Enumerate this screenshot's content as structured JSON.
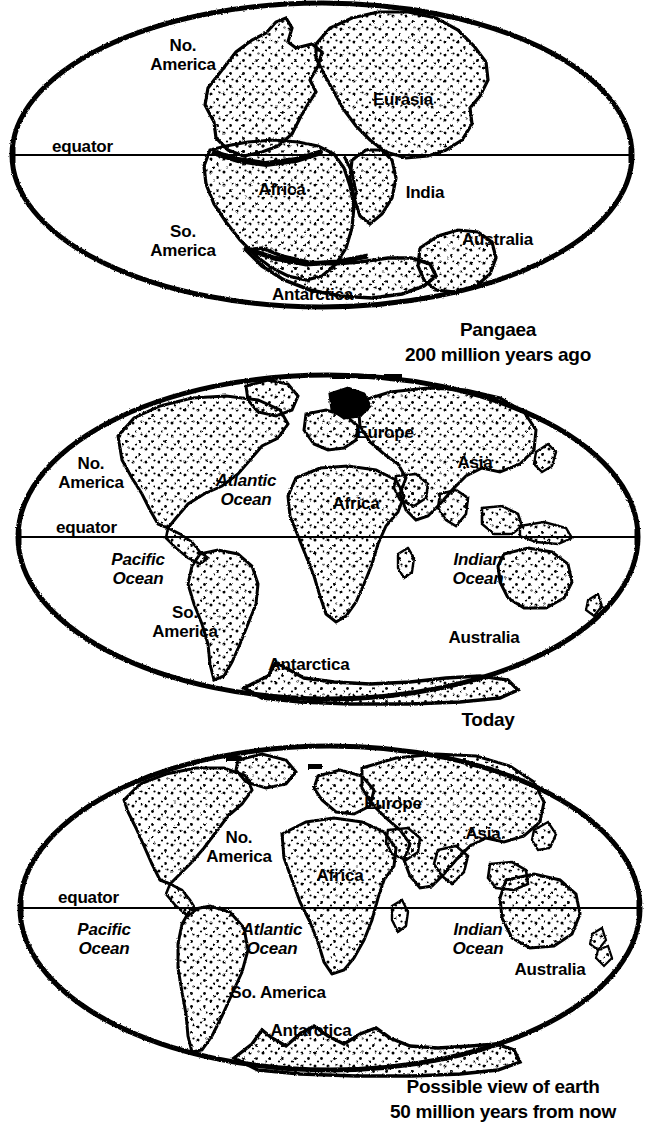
{
  "document": {
    "title": "Continental Drift — Pangaea, Today, and the Future",
    "background_color": "#ffffff",
    "ink_color": "#000000"
  },
  "panels": [
    {
      "id": "pangaea",
      "caption_line1": "Pangaea",
      "caption_line2": "200 million years ago",
      "equator_label": "equator",
      "labels": [
        {
          "name": "no-america",
          "text": "No.\nAmerica",
          "style": "land"
        },
        {
          "name": "eurasia",
          "text": "Eurasia",
          "style": "land"
        },
        {
          "name": "africa",
          "text": "Africa",
          "style": "land"
        },
        {
          "name": "india",
          "text": "India",
          "style": "land"
        },
        {
          "name": "so-america",
          "text": "So.\nAmerica",
          "style": "land"
        },
        {
          "name": "australia",
          "text": "Australia",
          "style": "land"
        },
        {
          "name": "antarctica",
          "text": "Antarctica",
          "style": "land"
        }
      ]
    },
    {
      "id": "today",
      "caption_line1": "Today",
      "caption_line2": "",
      "equator_label": "equator",
      "labels": [
        {
          "name": "no-america",
          "text": "No.\nAmerica",
          "style": "land"
        },
        {
          "name": "europe",
          "text": "Europe",
          "style": "land"
        },
        {
          "name": "asia",
          "text": "Asia",
          "style": "land"
        },
        {
          "name": "africa",
          "text": "Africa",
          "style": "land"
        },
        {
          "name": "atlantic-ocean",
          "text": "Atlantic\nOcean",
          "style": "ocean"
        },
        {
          "name": "pacific-ocean",
          "text": "Pacific\nOcean",
          "style": "ocean"
        },
        {
          "name": "indian-ocean",
          "text": "Indian\nOcean",
          "style": "ocean"
        },
        {
          "name": "so-america",
          "text": "So.\nAmerica",
          "style": "land"
        },
        {
          "name": "australia",
          "text": "Australia",
          "style": "land"
        },
        {
          "name": "antarctica",
          "text": "Antarctica",
          "style": "land"
        }
      ]
    },
    {
      "id": "future",
      "caption_line1": "Possible view of earth",
      "caption_line2": "50 million years from now",
      "equator_label": "equator",
      "labels": [
        {
          "name": "no-america",
          "text": "No.\nAmerica",
          "style": "land"
        },
        {
          "name": "europe",
          "text": "Europe",
          "style": "land"
        },
        {
          "name": "asia",
          "text": "Asia",
          "style": "land"
        },
        {
          "name": "africa",
          "text": "Africa",
          "style": "land"
        },
        {
          "name": "pacific-ocean",
          "text": "Pacific\nOcean",
          "style": "ocean"
        },
        {
          "name": "atlantic-ocean",
          "text": "Atlantic\nOcean",
          "style": "ocean"
        },
        {
          "name": "indian-ocean",
          "text": "Indian\nOcean",
          "style": "ocean"
        },
        {
          "name": "so-america",
          "text": "So. America",
          "style": "land"
        },
        {
          "name": "australia",
          "text": "Australia",
          "style": "land"
        },
        {
          "name": "antarctica",
          "text": "Antarctica",
          "style": "land"
        }
      ]
    }
  ],
  "text": {
    "equator": "equator",
    "p1": {
      "no_america": "No.\nAmerica",
      "eurasia": "Eurasia",
      "africa": "Africa",
      "india": "India",
      "so_america": "So.\nAmerica",
      "australia": "Australia",
      "antarctica": "Antarctica",
      "caption1": "Pangaea",
      "caption2": "200 million years ago"
    },
    "p2": {
      "no_america": "No.\nAmerica",
      "europe": "Europe",
      "asia": "Asia",
      "africa": "Africa",
      "atlantic": "Atlantic\nOcean",
      "pacific": "Pacific\nOcean",
      "indian": "Indian\nOcean",
      "so_america": "So.\nAmerica",
      "australia": "Australia",
      "antarctica": "Antarctica",
      "caption1": "Today"
    },
    "p3": {
      "no_america": "No.\nAmerica",
      "europe": "Europe",
      "asia": "Asia",
      "africa": "Africa",
      "pacific": "Pacific\nOcean",
      "atlantic": "Atlantic\nOcean",
      "indian": "Indian\nOcean",
      "so_america": "So. America",
      "australia": "Australia",
      "antarctica": "Antarctica",
      "caption1": "Possible view of earth",
      "caption2": "50 million years from now"
    }
  }
}
